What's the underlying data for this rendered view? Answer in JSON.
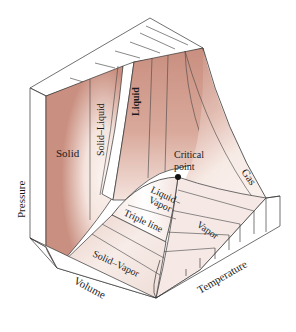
{
  "diagram": {
    "axes": {
      "pressure": "Pressure",
      "volume": "Volume",
      "temperature": "Temperature"
    },
    "regions": {
      "solid": "Solid",
      "solid_liquid": "Solid–Liquid",
      "liquid": "Liquid",
      "gas": "Gas",
      "vapor": "Vapor",
      "liquid_vapor_1": "Liquid–",
      "liquid_vapor_2": "Vapor",
      "solid_vapor": "Solid–Vapor",
      "triple_line": "Triple line"
    },
    "annotations": {
      "critical_point_1": "Critical",
      "critical_point_2": "point"
    },
    "colors": {
      "surface_dark": "#c98f80",
      "surface_light": "#f7ebe6",
      "outline": "#333333",
      "background": "#ffffff"
    }
  }
}
